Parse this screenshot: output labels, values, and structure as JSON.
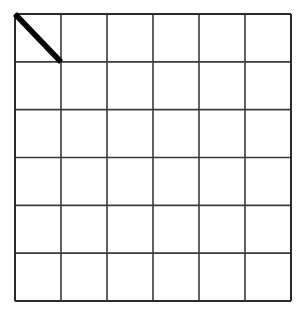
{
  "figure": {
    "kind": "grid-diagram",
    "background_color": "#ffffff",
    "canvas": {
      "width": 304,
      "height": 320
    }
  },
  "grid": {
    "name": "square-grid",
    "columns": 6,
    "rows": 6,
    "x": 15,
    "y": 14,
    "width": 276,
    "height": 287,
    "cell_width": 46,
    "cell_height": 47.83,
    "line_color": "#3a3a3a",
    "outer_line_color": "#2b2b2b",
    "line_width": 1.6,
    "outer_line_width": 2.0,
    "cell_fill": "#ffffff"
  },
  "marks": [
    {
      "name": "diagonal-stroke",
      "type": "line",
      "description": "thick black diagonal from top-left corner to bottom-right corner of the first cell",
      "cell_row": 1,
      "cell_column": 1,
      "x1": 15,
      "y1": 14,
      "x2": 61,
      "y2": 62,
      "color": "#000000",
      "line_width": 5.5,
      "line_cap": "butt"
    }
  ],
  "labels": {
    "title": "",
    "caption": "",
    "row_labels": [],
    "column_labels": []
  }
}
